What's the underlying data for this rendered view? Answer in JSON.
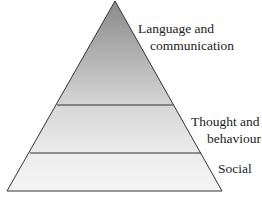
{
  "diagram": {
    "type": "pyramid",
    "levels": [
      {
        "label_line1": "Language and",
        "label_line2": "communication",
        "position": "top"
      },
      {
        "label_line1": "Thought and",
        "label_line2": "behaviour",
        "position": "middle"
      },
      {
        "label_line1": "Social",
        "position": "bottom"
      }
    ],
    "colors": {
      "top_gradient_start": "#8f8f8f",
      "bottom_fill": "#f3f3f3",
      "stroke": "#333333"
    }
  }
}
